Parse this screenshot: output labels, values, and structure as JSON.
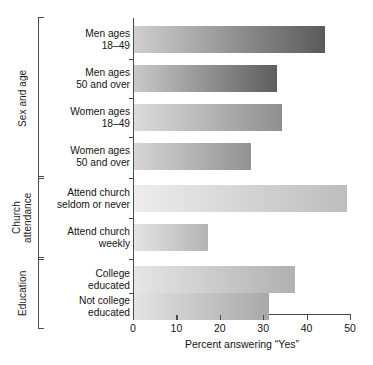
{
  "chart_data": {
    "type": "bar",
    "orientation": "horizontal",
    "title": "",
    "xlabel": "Percent answering “Yes”",
    "ylabel": "",
    "xlim": [
      0,
      50
    ],
    "xticks": [
      0,
      10,
      20,
      30,
      40,
      50
    ],
    "xtick_labels": [
      "0",
      "10",
      "20",
      "30",
      "40",
      "50"
    ],
    "grid": false,
    "legend": false,
    "categories": [
      "Men ages\n18–49",
      "Men ages\n50 and over",
      "Women ages\n18–49",
      "Women ages\n50 and over",
      "Attend church\nseldom or never",
      "Attend church\nweekly",
      "College\neducated",
      "Not college\neducated"
    ],
    "values": [
      44,
      33,
      34,
      27,
      49,
      17,
      37,
      31
    ],
    "bar_gradients": [
      {
        "from": "#cfcfcf",
        "to": "#5a5a5a"
      },
      {
        "from": "#c9c9c9",
        "to": "#5e5e5e"
      },
      {
        "from": "#dcdcdc",
        "to": "#8e8e8e"
      },
      {
        "from": "#d6d6d6",
        "to": "#919191"
      },
      {
        "from": "#ededed",
        "to": "#bdbdbd"
      },
      {
        "from": "#e4e4e4",
        "to": "#b3b3b3"
      },
      {
        "from": "#e6e6e6",
        "to": "#b0b0b0"
      },
      {
        "from": "#e3e3e3",
        "to": "#a8a8a8"
      }
    ],
    "groups": [
      {
        "label": "Sex and age",
        "bar_indices": [
          0,
          1,
          2,
          3
        ]
      },
      {
        "label": "Church\nattendance",
        "bar_indices": [
          4,
          5
        ]
      },
      {
        "label": "Education",
        "bar_indices": [
          6,
          7
        ]
      }
    ]
  },
  "axis": {
    "x_title": "Percent answering “Yes”"
  }
}
